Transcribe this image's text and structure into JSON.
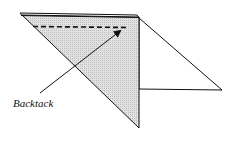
{
  "figure": {
    "type": "sewing-instruction-diagram",
    "colors": {
      "stroke": "#111111",
      "shaded_fill": "#d6d6d6",
      "background": "#ffffff"
    },
    "labels": {
      "backtack": "Backtack"
    }
  }
}
